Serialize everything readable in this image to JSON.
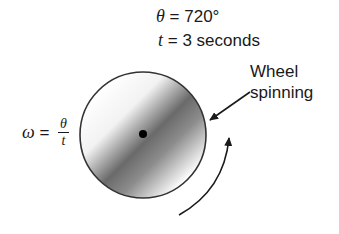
{
  "diagram": {
    "title_lines": {
      "theta_symbol": "θ",
      "theta_value": " = 720°",
      "t_symbol": "t",
      "t_value": " = 3 seconds"
    },
    "formula": {
      "lhs": "ω",
      "eq": " = ",
      "numerator": "θ",
      "denominator": "t"
    },
    "callout": {
      "line1": "Wheel",
      "line2": "spinning"
    },
    "wheel": {
      "center": [
        143,
        135
      ],
      "radius": 63,
      "shade_dark": "#5a5a5a",
      "shade_light": "#ffffff",
      "outline": "#333333"
    },
    "rotation_direction": "counterclockwise"
  }
}
